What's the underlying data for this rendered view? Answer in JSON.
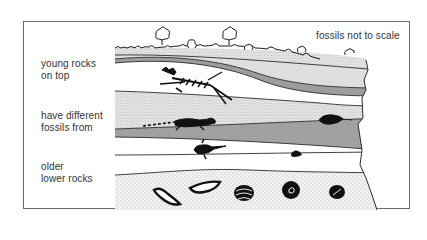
{
  "diagram": {
    "title_note": "fossils not to scale",
    "labels": [
      {
        "line1": "young rocks",
        "line2": "on top"
      },
      {
        "line1": "have different",
        "line2": "fossils from"
      },
      {
        "line1": "older",
        "line2": "lower rocks"
      }
    ],
    "strata_top_to_bottom": [
      "stippled topsoil with trees and shrubs",
      "light gray band",
      "dark gray band",
      "white layer with mammal skeleton fossil",
      "stippled layer with reptile skeleton fossil",
      "dark gray band",
      "white layer with fish and small fossil",
      "white layer",
      "stippled layer with shell fossils"
    ],
    "fossils": [
      "mammal-skeleton",
      "crocodile-skeleton",
      "trilobite-like fossil",
      "fish",
      "small fossil fragment",
      "brachiopod shell",
      "brachiopod shell",
      "ribbed clam shell",
      "ammonite",
      "sea urchin"
    ],
    "colors": {
      "ink": "#1a1a1a",
      "light_gray": "#dcdcdc",
      "dark_gray": "#9a9a9a",
      "stipple_bg": "#ececec",
      "white": "#ffffff"
    }
  }
}
